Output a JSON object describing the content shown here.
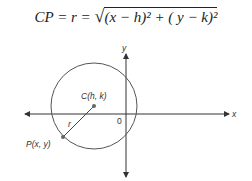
{
  "formula": {
    "lhs": "CP = r = ",
    "radicand": "(x − h)² + ( y − k)²"
  },
  "diagram": {
    "x_axis_label": "x",
    "y_axis_label": "y",
    "origin_label": "0",
    "center_label": "C(h, k)",
    "point_label": "P(x, y)",
    "radius_label": "r"
  }
}
